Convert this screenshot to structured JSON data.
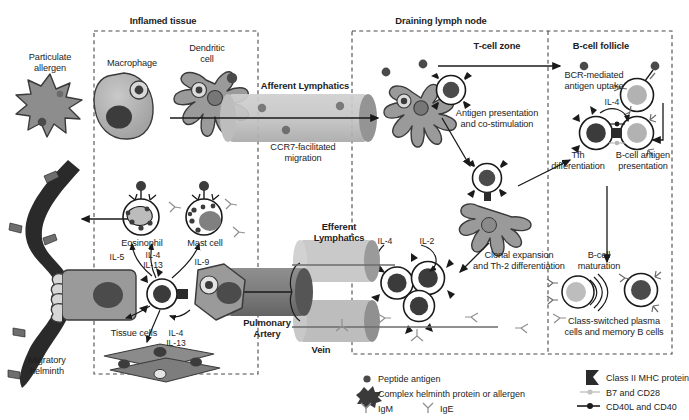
{
  "figure": {
    "compartments": [
      {
        "id": "inflamed-tissue",
        "label": "Inflamed tissue"
      },
      {
        "id": "draining-lymph-node",
        "label": "Draining lymph node"
      },
      {
        "id": "t-cell-zone",
        "label": "T-cell zone"
      },
      {
        "id": "b-cell-follicle",
        "label": "B-cell follicle"
      }
    ]
  },
  "labels": {
    "particulate_allergen": "Particulate\nallergen",
    "macrophage": "Macrophage",
    "dendritic_cell": "Dendritic\ncell",
    "afferent_lymphatics": "Afferent Lymphatics",
    "ccr7_migration": "CCR7-facilitated\nmigration",
    "antigen_presentation": "Antigen presentation\nand co-stimulation",
    "bcr_uptake": "BCR-mediated\nantigen uptake",
    "tfh_differentiation": "Tfh\ndifferentiation",
    "bcell_antigen_presentation": "B-cell antigen\npresentation",
    "clonal_expansion": "Clonal expansion\nand Th-2 differentiation",
    "bcell_maturation": "B-cell\nmaturation",
    "class_switched": "Class-switched plasma\ncells and memory B cells",
    "efferent_lymphatics": "Efferent\nLymphatics",
    "pulmonary_artery": "Pulmonary\nArtery",
    "vein": "Vein",
    "eosinophil": "Eosinophil",
    "mast_cell": "Mast cell",
    "tissue_cells": "Tissue cells",
    "migratory_helminth": "Migratory\nhelminth"
  },
  "cytokines": {
    "il4_follicle": "IL-4",
    "il4_clonal": "IL-4",
    "il2_clonal": "IL-2",
    "il5": "IL-5",
    "il4_il13_top": "IL-4\nIL-13",
    "il9": "IL-9",
    "il4_il13_bottom": "IL-4\nIL-13"
  },
  "legend": {
    "left": [
      {
        "key": "peptide-antigen",
        "label": "Peptide antigen",
        "icon": "small-dark-dot"
      },
      {
        "key": "complex-helminth",
        "label": "Complex helminth protein or allergen",
        "icon": "spiky-blob"
      },
      {
        "key": "igm",
        "label": "IgM",
        "icon": "y-antibody"
      },
      {
        "key": "ige",
        "label": "IgE",
        "icon": "y-antibody"
      }
    ],
    "right": [
      {
        "key": "class-ii-mhc",
        "label": "Class II MHC protein",
        "icon": "mhc-bracket"
      },
      {
        "key": "b7-cd28",
        "label": "B7 and CD28",
        "icon": "light-rod-pair"
      },
      {
        "key": "cd40l-cd40",
        "label": "CD40L and CD40",
        "icon": "dark-rod-pair"
      }
    ]
  },
  "colors": {
    "dark_gray": "#4a4a4a",
    "mid_gray": "#8d8d8d",
    "light_gray": "#b9b9b9",
    "pale_gray": "#d4d4d4",
    "vessel_gray": "#c2c2c2",
    "nucleus_dark": "#3c3c3c",
    "ink": "#1a1a1a",
    "helminth": "#2a2a2a"
  }
}
